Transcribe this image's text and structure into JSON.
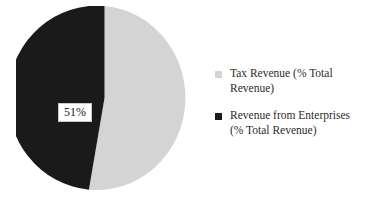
{
  "chart_data": {
    "type": "pie",
    "title": "",
    "subtitle": "",
    "xlabel": "",
    "ylabel": "",
    "grid": false,
    "legend_position": "right",
    "start_angle_deg": 0,
    "direction": "counterclockwise",
    "categories": [
      "Tax Revenue (% Total Revenue)",
      "Revenue from Enterprises (% Total Revenue)"
    ],
    "values": [
      49,
      51
    ],
    "value_unit": "%",
    "data_labels": [
      {
        "category": "Revenue from Enterprises (% Total Revenue)",
        "text": "51%",
        "value": 51
      }
    ],
    "colors": [
      "#d4d4d4",
      "#1a1a1a"
    ],
    "background": "#ffffff"
  },
  "pie": {
    "slices": [
      {
        "name": "tax-revenue",
        "label": "Tax Revenue (% Total Revenue)",
        "value": 49,
        "color": "#d4d4d4",
        "path": "M 88.5,92 L 88.5,0 A 88.5,92 0 1 1 72.9,183.7 Z"
      },
      {
        "name": "revenue-from-enterprises",
        "label": "Revenue from Enterprises (% Total Revenue)",
        "value": 51,
        "color": "#1a1a1a",
        "path": "M 88.5,92 L 72.9,183.7 A 88.5,92 0 1 1 88.5,0 Z"
      }
    ],
    "label_text": "51%"
  },
  "legend": {
    "items": [
      {
        "label": "Tax Revenue (% Total Revenue)",
        "color": "#d4d4d4",
        "swatch_name": "legend-swatch-tax-revenue"
      },
      {
        "label": "Revenue from Enterprises (% Total Revenue)",
        "color": "#1a1a1a",
        "swatch_name": "legend-swatch-revenue-from-enterprises"
      }
    ]
  }
}
